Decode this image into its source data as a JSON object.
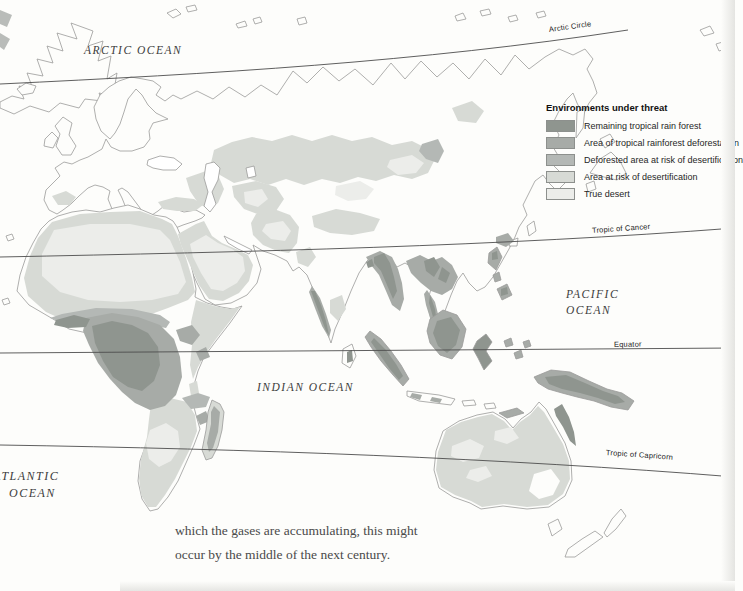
{
  "legend": {
    "title": "Environments under threat",
    "items": [
      {
        "label": "Remaining tropical rain forest",
        "color": "#8f958f"
      },
      {
        "label": "Area of tropical rainforest deforestation",
        "color": "#a7aba7"
      },
      {
        "label": "Deforested area at risk of desertification",
        "color": "#b4b8b5"
      },
      {
        "label": "Area at risk of desertification",
        "color": "#d7dad5"
      },
      {
        "label": "True desert",
        "color": "#ecedea"
      }
    ]
  },
  "map": {
    "oceans": {
      "arctic": "ARCTIC OCEAN",
      "pacific_line1": "PACIFIC",
      "pacific_line2": "OCEAN",
      "indian": "INDIAN OCEAN",
      "atlantic_line1": "ATLANTIC",
      "atlantic_line2": "OCEAN"
    },
    "latitude_lines": {
      "arctic_circle": "Arctic Circle",
      "tropic_of_cancer": "Tropic of Cancer",
      "equator": "Equator",
      "tropic_of_capricorn": "Tropic of Capricorn"
    }
  },
  "caption": {
    "line1": "which the gases are accumulating, this might",
    "line2": "occur by the middle of the next century."
  },
  "palette": {
    "rainforest": "#8f958f",
    "deforestation": "#a7aba7",
    "deforested-risk": "#b4b8b5",
    "risk": "#d7dad5",
    "desert": "#ecedea",
    "coast": "#9b9b99",
    "latline": "#4d4d4d"
  }
}
